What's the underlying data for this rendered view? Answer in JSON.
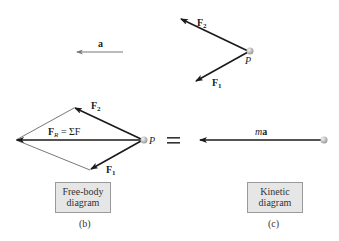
{
  "figure": {
    "panel_a": {
      "acceleration_label": "a",
      "force_1_label": "F",
      "force_1_sub": "1",
      "force_2_label": "F",
      "force_2_sub": "2",
      "point_label": "P"
    },
    "panel_b": {
      "resultant_label_main": "F",
      "resultant_label_sub": "R",
      "resultant_label_rest": " = ΣF",
      "force_1_label": "F",
      "force_1_sub": "1",
      "force_2_label": "F",
      "force_2_sub": "2",
      "point_label": "P",
      "box_line1": "Free-body",
      "box_line2": "diagram",
      "caption": "(b)"
    },
    "equals_sign": "=",
    "panel_c": {
      "vector_label_m": "m",
      "vector_label_a": "a",
      "box_line1": "Kinetic",
      "box_line2": "diagram",
      "caption": "(c)"
    },
    "colors": {
      "arrow": "#1a1a1a",
      "thin_arrow": "#777777",
      "particle": "#c8c8c8",
      "box_fill": "#e6e6e6",
      "box_border": "#9a9a9a"
    }
  }
}
